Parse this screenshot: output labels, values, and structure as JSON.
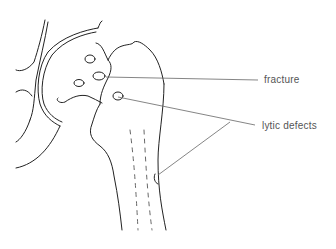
{
  "diagram": {
    "labels": {
      "fracture": "fracture",
      "lytic_defects": "lytic defects"
    },
    "colors": {
      "line": "#222222",
      "leader": "#666666",
      "label": "#555555"
    }
  }
}
